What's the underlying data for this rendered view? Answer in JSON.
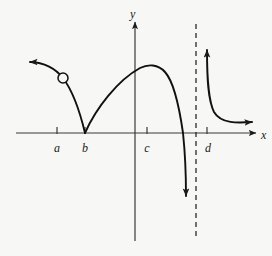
{
  "figure": {
    "title": "",
    "background_color": "#f7f7f5",
    "ink_color": "#1a1a1a"
  },
  "axes": {
    "x_axis": {
      "label": "x",
      "label_x": 261,
      "label_y": 139,
      "start_x": 16,
      "end_x": 256,
      "y": 133,
      "arrow": "right"
    },
    "y_axis": {
      "label": "y",
      "label_x": 130,
      "label_y": 18,
      "x": 135,
      "start_y": 241,
      "end_y": 22,
      "arrow": "up"
    }
  },
  "ticks": [
    {
      "name": "a",
      "label": "a",
      "x": 57,
      "label_x": 57,
      "label_y": 152
    },
    {
      "name": "b",
      "label": "b",
      "x": 85,
      "label_x": 85,
      "label_y": 152
    },
    {
      "name": "c",
      "label": "c",
      "x": 147,
      "label_x": 147,
      "label_y": 152
    },
    {
      "name": "d",
      "label": "d",
      "x": 207,
      "label_x": 208,
      "label_y": 152
    }
  ],
  "asymptote": {
    "name": "vertical-asymptote",
    "style": "dashed",
    "x": 196,
    "top_y": 24,
    "bottom_y": 236
  },
  "hole": {
    "name": "open-circle-discontinuity",
    "cx": 63,
    "cy": 78,
    "r": 5,
    "fill": "#f7f7f5"
  },
  "chart_data": {
    "type": "line",
    "title": "",
    "xlabel": "x",
    "ylabel": "y",
    "grid": false,
    "legend": false,
    "xticks": [
      "a",
      "b",
      "c",
      "d"
    ],
    "yticks": [],
    "annotations": [
      "open circle (removable discontinuity) on left branch above and left of b",
      "cusp / corner where curve touches x-axis at b",
      "local maximum between c and the asymptote",
      "vertical dashed asymptote between d tick and the branch descending to minus infinity",
      "branch right of the asymptote decreases from plus infinity toward the x-axis"
    ],
    "series": [
      {
        "name": "left-branch",
        "description": "decreasing from upper-left arrow through the open circle down to the x-axis at b",
        "arrow_start": true,
        "arrow_end": false,
        "path": "M 30,62 C 44,62 56,69 63,78 C 72,90 80,112 85,133"
      },
      {
        "name": "middle-branch",
        "description": "rises from the cusp at b, peaks between c and the asymptote, then plunges to minus infinity",
        "arrow_start": false,
        "arrow_end": true,
        "path": "M 85,133 C 96,108 118,80 140,68 C 148,64 158,64 165,72 C 174,82 179,105 183,133 C 185,152 186,175 186,196"
      },
      {
        "name": "right-branch",
        "description": "drops from plus infinity just right of the asymptote and flattens toward the x-axis going right",
        "arrow_start": true,
        "arrow_end": true,
        "path": "M 207,50 C 207,78 208,100 214,112 C 221,124 238,123 252,122"
      }
    ]
  },
  "arrows": [
    {
      "name": "left-branch-arrow",
      "tip_x": 30,
      "tip_y": 62,
      "direction": "up-left"
    },
    {
      "name": "middle-branch-arrow",
      "tip_x": 186,
      "tip_y": 199,
      "direction": "down"
    },
    {
      "name": "right-branch-up-arrow",
      "tip_x": 207,
      "tip_y": 47,
      "direction": "up"
    },
    {
      "name": "right-branch-right-arrow",
      "tip_x": 256,
      "tip_y": 122,
      "direction": "right"
    },
    {
      "name": "x-axis-arrow",
      "tip_x": 258,
      "tip_y": 133,
      "direction": "right"
    },
    {
      "name": "y-axis-arrow",
      "tip_x": 135,
      "tip_y": 20,
      "direction": "up"
    }
  ]
}
